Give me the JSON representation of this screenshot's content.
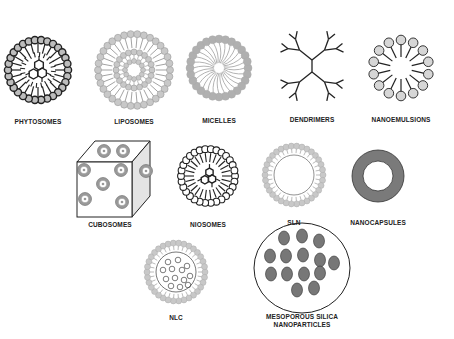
{
  "diagram": {
    "items": [
      {
        "id": "phytosomes",
        "label": "PHYTOSOMES",
        "cx": 38,
        "cy": 70,
        "label_y": 118
      },
      {
        "id": "liposomes",
        "label": "LIPOSOMES",
        "cx": 134,
        "cy": 70,
        "label_y": 118
      },
      {
        "id": "micelles",
        "label": "MICELLES",
        "cx": 219,
        "cy": 68,
        "label_y": 117
      },
      {
        "id": "dendrimers",
        "label": "DENDRIMERS",
        "cx": 312,
        "cy": 66,
        "label_y": 116
      },
      {
        "id": "nanoemulsions",
        "label": "NANOEMULSIONS",
        "cx": 401,
        "cy": 68,
        "label_y": 116
      },
      {
        "id": "cubosomes",
        "label": "CUBOSOMES",
        "cx": 110,
        "cy": 178,
        "label_y": 221
      },
      {
        "id": "niosomes",
        "label": "NIOSOMES",
        "cx": 208,
        "cy": 176,
        "label_y": 221
      },
      {
        "id": "sln",
        "label": "SLN",
        "cx": 294,
        "cy": 175,
        "label_y": 219
      },
      {
        "id": "nanocapsules",
        "label": "NANOCAPSULES",
        "cx": 378,
        "cy": 176,
        "label_y": 219
      },
      {
        "id": "nlc",
        "label": "NLC",
        "cx": 176,
        "cy": 272,
        "label_y": 314
      },
      {
        "id": "mesoporous",
        "label": "MESOPOROUS SILICA",
        "label2": "NANOPARTICLES",
        "cx": 302,
        "cy": 268,
        "label_y": 313
      }
    ]
  },
  "colors": {
    "line": "#222222",
    "head_gray": "#c8c8c8",
    "head_dark_fill": "#bdbdbd",
    "micelle_gray": "#b0b0b0",
    "capsule_gray": "#7a7a7a",
    "pore_gray": "#777777",
    "cube_side": "#e4e4e4"
  }
}
